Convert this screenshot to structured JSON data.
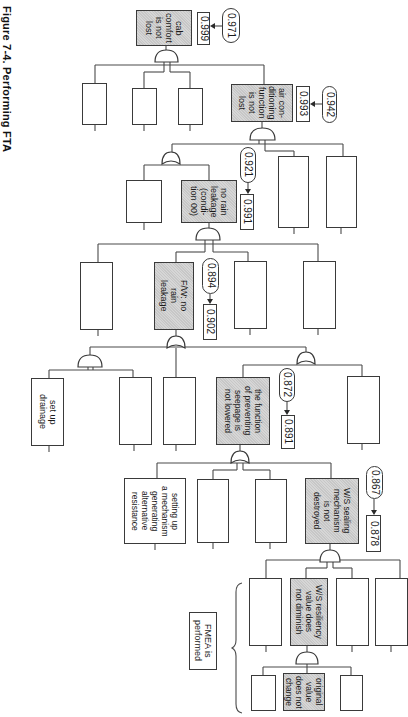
{
  "figure": {
    "caption": "Figure 7-4. Performing FTA",
    "orientation": "rotated 90° clockwise"
  },
  "events": {
    "cab_comfort": {
      "label": "cab\ncomfort\nis not\nlost",
      "value": "0.999",
      "target": "0.971"
    },
    "air_conditioning": {
      "label": "air con-\nditioning\nfunction\nis not\nlost",
      "value": "0.993",
      "target": "0.942"
    },
    "no_rain_leakage": {
      "label": "no rain\nleakage\n(condi-\ntion 00)",
      "value": "0.991",
      "target": "0.921"
    },
    "fw_no_rain_leakage": {
      "label": "F/W: no\nrain\nleakage",
      "value": "0.902",
      "target": "0.894"
    },
    "seepage_function": {
      "label": "the function\nof preventing\nseepage is\nnot lowered",
      "value": "0.891",
      "target": "0.872"
    },
    "ws_sealing": {
      "label": "W/S sealing\nmechanism\nis not\ndestroyed",
      "value": "0.878",
      "target": "0.867"
    },
    "ws_resiliency": {
      "label": "W/S resiliency\nvalue does\nnot diminish"
    },
    "original_value": {
      "label": "original\nvalue\ndoes not\nchange"
    },
    "set_up_drainage": {
      "label": "set up\ndrainage"
    },
    "alt_resistance": {
      "label": "setting up\na mechanism\ngenerating\nalternative\nresistance"
    }
  },
  "annotations": {
    "fmea": "FMEA is\nperformed"
  },
  "colors": {
    "line": "#3a3a3a",
    "shaded_fill": "#d6d6d6",
    "background": "#ffffff"
  }
}
